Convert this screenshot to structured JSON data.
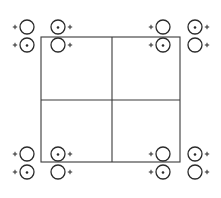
{
  "diagram": {
    "type": "lattice-grid-with-symbols",
    "grid": {
      "rows": 2,
      "cols": 2,
      "left": 41,
      "right": 180,
      "top": 37,
      "bottom": 162,
      "mid_x": 112,
      "mid_y": 100,
      "color": "#3a3a3a"
    },
    "symbol_color": "#2a2a2a",
    "circle_radius": 7,
    "clusters": [
      {
        "name": "top-left",
        "symbols": [
          {
            "x": 27,
            "y": 27,
            "dotted": false,
            "plus_side": "left"
          },
          {
            "x": 58,
            "y": 27,
            "dotted": true,
            "plus_side": "right"
          },
          {
            "x": 27,
            "y": 45,
            "dotted": true,
            "plus_side": "left"
          },
          {
            "x": 58,
            "y": 45,
            "dotted": false,
            "plus_side": "right"
          }
        ]
      },
      {
        "name": "top-right",
        "symbols": [
          {
            "x": 163,
            "y": 27,
            "dotted": false,
            "plus_side": "left"
          },
          {
            "x": 195,
            "y": 27,
            "dotted": true,
            "plus_side": "right"
          },
          {
            "x": 163,
            "y": 45,
            "dotted": true,
            "plus_side": "left"
          },
          {
            "x": 195,
            "y": 45,
            "dotted": false,
            "plus_side": "right"
          }
        ]
      },
      {
        "name": "bottom-left",
        "symbols": [
          {
            "x": 27,
            "y": 154,
            "dotted": false,
            "plus_side": "left"
          },
          {
            "x": 58,
            "y": 154,
            "dotted": true,
            "plus_side": "right"
          },
          {
            "x": 27,
            "y": 172,
            "dotted": true,
            "plus_side": "left"
          },
          {
            "x": 58,
            "y": 172,
            "dotted": false,
            "plus_side": "right"
          }
        ]
      },
      {
        "name": "bottom-right",
        "symbols": [
          {
            "x": 163,
            "y": 154,
            "dotted": false,
            "plus_side": "left"
          },
          {
            "x": 195,
            "y": 154,
            "dotted": true,
            "plus_side": "right"
          },
          {
            "x": 163,
            "y": 172,
            "dotted": true,
            "plus_side": "left"
          },
          {
            "x": 195,
            "y": 172,
            "dotted": false,
            "plus_side": "right"
          }
        ]
      }
    ],
    "symbol_labels": {
      "plus": "+"
    }
  }
}
